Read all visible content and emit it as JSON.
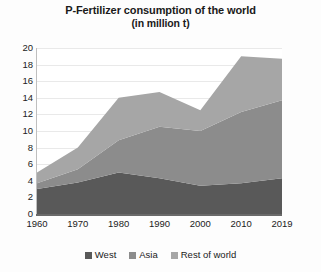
{
  "chart_data": {
    "type": "area",
    "stacked": true,
    "title": "P-Fertilizer consumption of the world",
    "subtitle": "(in million t)",
    "xlabel": "",
    "ylabel": "",
    "x": [
      1960,
      1970,
      1980,
      1990,
      2000,
      2010,
      2019
    ],
    "xtick_labels": [
      "1960",
      "1970",
      "1980",
      "1990",
      "2000",
      "2010",
      "2019"
    ],
    "ytick_labels": [
      "0",
      "2",
      "4",
      "6",
      "8",
      "10",
      "12",
      "14",
      "16",
      "18",
      "20"
    ],
    "ytick_values": [
      0,
      2,
      4,
      6,
      8,
      10,
      12,
      14,
      16,
      18,
      20
    ],
    "ylim": [
      0,
      20
    ],
    "xlim": [
      1960,
      2019
    ],
    "grid": true,
    "legend_position": "bottom",
    "series": [
      {
        "name": "West",
        "color": "#595959",
        "values": [
          3.0,
          3.8,
          5.0,
          4.3,
          3.4,
          3.7,
          4.3
        ]
      },
      {
        "name": "Asia",
        "color": "#8c8c8c",
        "values": [
          0.7,
          1.6,
          3.9,
          6.2,
          6.6,
          8.6,
          9.4
        ]
      },
      {
        "name": "Rest of world",
        "color": "#a6a6a6",
        "values": [
          1.3,
          2.6,
          5.1,
          4.2,
          2.5,
          6.7,
          5.0
        ]
      }
    ],
    "totals": [
      5.0,
      8.0,
      14.0,
      14.7,
      12.5,
      19.0,
      18.7
    ]
  },
  "legend": {
    "items": [
      {
        "label": "West",
        "color": "#595959"
      },
      {
        "label": "Asia",
        "color": "#8c8c8c"
      },
      {
        "label": "Rest of world",
        "color": "#a6a6a6"
      }
    ]
  }
}
